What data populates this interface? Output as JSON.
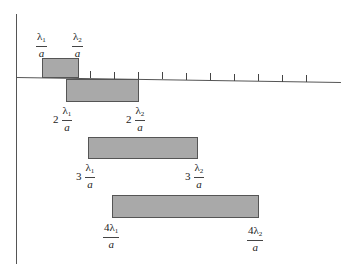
{
  "diagram": {
    "type": "spectral-order-overlap",
    "colors": {
      "bar_fill": "#a9a9a9",
      "bar_border": "#555555",
      "axis": "#555555"
    },
    "axis": {
      "ticks_x": [
        66,
        90,
        114,
        138,
        162,
        186,
        210,
        234,
        258,
        282,
        306
      ]
    },
    "orders": [
      {
        "order": 1,
        "start_label": {
          "coef": "",
          "num": "λ",
          "sub": "1",
          "den": "a"
        },
        "end_label": {
          "coef": "",
          "num": "λ",
          "sub": "2",
          "den": "a"
        }
      },
      {
        "order": 2,
        "start_label": {
          "coef": "2",
          "num": "λ",
          "sub": "1",
          "den": "a"
        },
        "end_label": {
          "coef": "2",
          "num": "λ",
          "sub": "2",
          "den": "a"
        }
      },
      {
        "order": 3,
        "start_label": {
          "coef": "3",
          "num": "λ",
          "sub": "1",
          "den": "a"
        },
        "end_label": {
          "coef": "3",
          "num": "λ",
          "sub": "2",
          "den": "a"
        }
      },
      {
        "order": 4,
        "start_label": {
          "coef": "",
          "num": "4λ",
          "sub": "1",
          "den": "a"
        },
        "end_label": {
          "coef": "",
          "num": "4λ",
          "sub": "2",
          "den": "a"
        }
      }
    ]
  }
}
